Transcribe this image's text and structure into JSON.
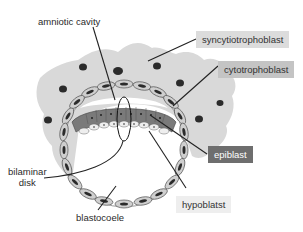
{
  "diagram": {
    "type": "embryology-cross-section",
    "labels": {
      "amniotic_cavity": "amniotic cavity",
      "syncytiotrophoblast": "syncytiotrophoblast",
      "cytotrophoblast": "cytotrophoblast",
      "epiblast": "epiblast",
      "bilaminar_disk": "bilaminar\ndisk",
      "bilaminar_disk_line1": "bilaminar",
      "bilaminar_disk_line2": "disk",
      "hypoblast": "hypoblatst",
      "blastocoele": "blastocoele"
    },
    "colors": {
      "syncytiotrophoblast_fill": "#d9d9d9",
      "cytotrophoblast_cell": "#c8c8c8",
      "epiblast_fill": "#777777",
      "hypoblast_cell": "#eeeeee",
      "nucleus": "#2b2b2b",
      "syncytio_box": "#dcdcdc",
      "cyto_box": "#c4c4c4",
      "epiblast_box": "#6e6e6e",
      "hypoblast_box": "#eeeeee"
    }
  }
}
